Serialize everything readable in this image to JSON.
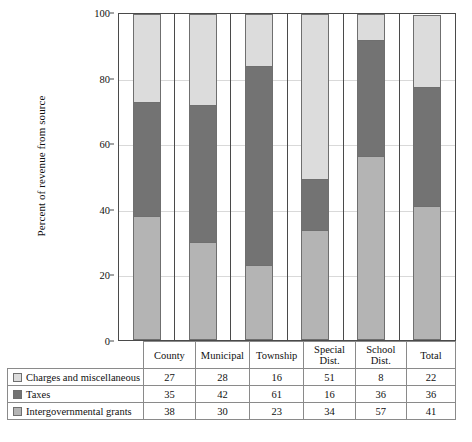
{
  "chart_data": {
    "type": "bar",
    "subtype": "stacked-bar-100-percent",
    "title": "",
    "xlabel": "",
    "ylabel": "Percent of revenue from source",
    "ylim": [
      0,
      100
    ],
    "yticks": [
      0,
      20,
      40,
      60,
      80,
      100
    ],
    "grid": true,
    "legend_position": "table-row-labels",
    "categories": [
      "County",
      "Municipal",
      "Township",
      "Special Dist.",
      "School Dist.",
      "Total"
    ],
    "series": [
      {
        "name": "Charges and miscellaneous",
        "values": [
          27,
          28,
          16,
          51,
          8,
          22
        ],
        "color": "#dcdcdc",
        "stack_position": "top"
      },
      {
        "name": "Taxes",
        "values": [
          35,
          42,
          61,
          16,
          36,
          36
        ],
        "color": "#737373",
        "stack_position": "middle"
      },
      {
        "name": "Intergovernmental grants",
        "values": [
          38,
          30,
          23,
          34,
          57,
          41
        ],
        "color": "#b4b4b4",
        "stack_position": "bottom"
      }
    ]
  },
  "table": {
    "header": [
      "",
      "County",
      "Municipal",
      "Township",
      "Special Dist.",
      "School Dist.",
      "Total"
    ],
    "rows": [
      {
        "label": "Charges and miscellaneous",
        "swatch": "#dcdcdc",
        "values": [
          "27",
          "28",
          "16",
          "51",
          "8",
          "22"
        ]
      },
      {
        "label": "Taxes",
        "swatch": "#737373",
        "values": [
          "35",
          "42",
          "61",
          "16",
          "36",
          "36"
        ]
      },
      {
        "label": "Intergovernmental grants",
        "swatch": "#b4b4b4",
        "values": [
          "38",
          "30",
          "23",
          "34",
          "57",
          "41"
        ]
      }
    ]
  },
  "axis": {
    "y_title": "Percent of revenue from source",
    "y_tick_labels": [
      "0",
      "20",
      "40",
      "60",
      "80",
      "100"
    ]
  },
  "colors": {
    "light_gray": "#dcdcdc",
    "dark_gray": "#737373",
    "medium_gray": "#b4b4b4",
    "axis_line": "#4a4a4a",
    "gridline": "#d9d9d9",
    "table_border": "#8a8a8a"
  }
}
